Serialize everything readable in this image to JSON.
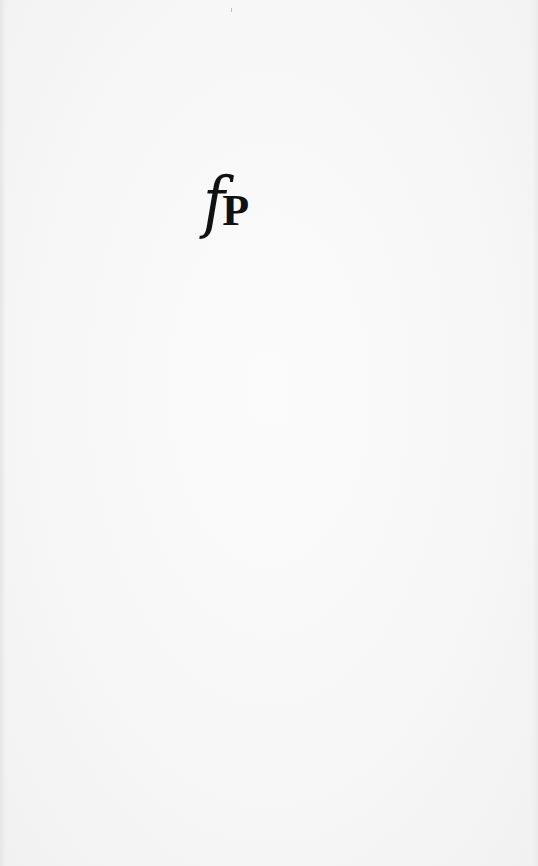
{
  "page": {
    "type": "scanned-book-page",
    "background_color": "#f5f5f5"
  },
  "logo": {
    "italic_letter": "f",
    "bold_letter": "P",
    "ink_color": "#111111"
  }
}
